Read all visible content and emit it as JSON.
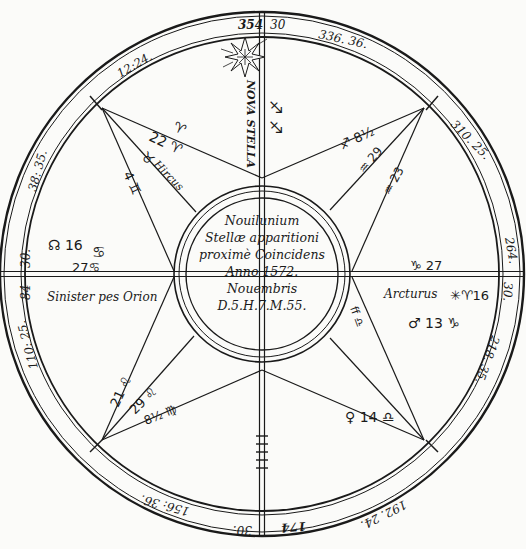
{
  "figure": {
    "type": "horoscope-chart",
    "center_inscription": [
      "Nouilunium",
      "Stellæ apparitioni",
      "proximè Coincidens",
      "Anno 1572.",
      "Nouembris",
      "D.5.H.7.M.55."
    ],
    "ring_labels": {
      "top_left_of_axis": "354",
      "top_right_of_axis": "30",
      "upper_left": "12:24.",
      "upper_right": "336. 36.",
      "right_upper": "310. 25.",
      "right_above_axis": "264.",
      "right_below_axis": "30.",
      "right_lower": "218. 35.",
      "left_upper": "38: 35.",
      "left_above_axis": "30.",
      "left_below_axis": "84",
      "left_lower": "110: 25.",
      "bottom_left": "156: 36.",
      "bottom_left_of_axis": "30.",
      "bottom_right_of_axis": "174",
      "bottom_right": "192. 24."
    },
    "annotations": {
      "nova": "NOVA STELLA",
      "hircus": "Hircus",
      "arcturus": "Arcturus",
      "orion": "Sinister pes Orionis",
      "orion_display": "Sinister pes Orion",
      "left_node": "☊ 16",
      "left_cancer_1": "♋",
      "left_cancer_2": "27♋",
      "right_capricorn": "♑ 27",
      "right_star": "✳♈16",
      "right_mars": "♂ 13 ♑",
      "lower_left_leo_1": "21 ♌",
      "lower_left_leo_2": "29 ♌",
      "lower_left_virgo": "8½ ♍",
      "lower_right_libra": "♀ 14 ♎",
      "lower_right_ft": "ff ♎",
      "upper_left_aries": "♈",
      "upper_left_aries_num": "22 ♈",
      "upper_left_taurus": "♉",
      "upper_left_gemini": "4 ♊",
      "upper_right_sag": "♐ 8½",
      "upper_right_aquarius": "♒ 29",
      "upper_right_aq2": "♒ 23",
      "top_axis_sym": "♐"
    },
    "colors": {
      "ink": "#1a1a1a",
      "paper": "#fbfbf9"
    }
  }
}
